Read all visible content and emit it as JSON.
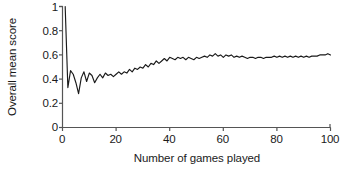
{
  "chart_data": {
    "type": "line",
    "title": "",
    "xlabel": "Number of games played",
    "ylabel": "Overall mean score",
    "xlim": [
      0,
      100
    ],
    "ylim": [
      0,
      1
    ],
    "xticks": [
      "0",
      "20",
      "40",
      "60",
      "80",
      "100"
    ],
    "xtick_values": [
      0,
      20,
      40,
      60,
      80,
      100
    ],
    "yticks": [
      "0",
      "0.2",
      "0.4",
      "0.6",
      "0.8",
      "1"
    ],
    "ytick_values": [
      0,
      0.2,
      0.4,
      0.6,
      0.8,
      1
    ],
    "grid": false,
    "legend": null,
    "line_color": "#1a1a1a",
    "background_color": "#ffffff",
    "axis_color": "#555555",
    "series": [
      {
        "name": "Overall mean score",
        "x": [
          1,
          2,
          3,
          4,
          5,
          6,
          7,
          8,
          9,
          10,
          11,
          12,
          13,
          14,
          15,
          16,
          17,
          18,
          19,
          20,
          21,
          22,
          23,
          24,
          25,
          26,
          27,
          28,
          29,
          30,
          31,
          32,
          33,
          34,
          35,
          36,
          37,
          38,
          39,
          40,
          41,
          42,
          43,
          44,
          45,
          46,
          47,
          48,
          49,
          50,
          51,
          52,
          53,
          54,
          55,
          56,
          57,
          58,
          59,
          60,
          61,
          62,
          63,
          64,
          65,
          66,
          67,
          68,
          69,
          70,
          71,
          72,
          73,
          74,
          75,
          76,
          77,
          78,
          79,
          80,
          81,
          82,
          83,
          84,
          85,
          86,
          87,
          88,
          89,
          90,
          91,
          92,
          93,
          94,
          95,
          96,
          97,
          98,
          99,
          100
        ],
        "values": [
          1.0,
          0.33,
          0.47,
          0.44,
          0.37,
          0.28,
          0.41,
          0.46,
          0.38,
          0.45,
          0.43,
          0.37,
          0.41,
          0.44,
          0.41,
          0.45,
          0.43,
          0.44,
          0.42,
          0.44,
          0.46,
          0.44,
          0.46,
          0.45,
          0.48,
          0.46,
          0.49,
          0.48,
          0.5,
          0.49,
          0.52,
          0.5,
          0.53,
          0.52,
          0.55,
          0.53,
          0.55,
          0.57,
          0.55,
          0.58,
          0.57,
          0.56,
          0.58,
          0.57,
          0.58,
          0.56,
          0.58,
          0.57,
          0.56,
          0.58,
          0.57,
          0.58,
          0.59,
          0.58,
          0.6,
          0.59,
          0.61,
          0.59,
          0.6,
          0.58,
          0.6,
          0.59,
          0.6,
          0.58,
          0.59,
          0.58,
          0.59,
          0.58,
          0.57,
          0.58,
          0.58,
          0.57,
          0.58,
          0.58,
          0.57,
          0.58,
          0.58,
          0.58,
          0.59,
          0.58,
          0.59,
          0.58,
          0.59,
          0.58,
          0.59,
          0.58,
          0.59,
          0.58,
          0.59,
          0.58,
          0.59,
          0.58,
          0.59,
          0.59,
          0.59,
          0.6,
          0.6,
          0.6,
          0.61,
          0.6
        ]
      }
    ]
  }
}
